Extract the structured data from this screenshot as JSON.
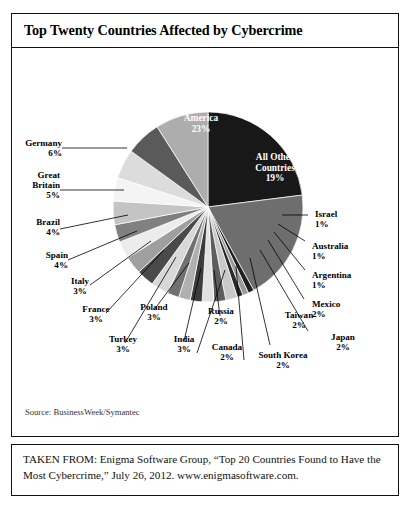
{
  "chart_box": {
    "title": "Top Twenty Countries Affected by Cybercrime",
    "source_note": "Source: BusinessWeek/Symantec"
  },
  "attribution": {
    "text": "TAKEN FROM: Enigma Software Group, “Top 20 Countries Found to Have the Most Cybercrime,” July 26, 2012. www.enigmasoftware.com."
  },
  "chart_data": {
    "type": "pie",
    "title": "Top Twenty Countries Affected by Cybercrime",
    "xlabel": "",
    "ylabel": "",
    "legend": "none",
    "grid": false,
    "units": "percent",
    "start_angle_deg": 0,
    "direction": "clockwise",
    "categories": [
      "United States of America",
      "All Other Countries",
      "Israel",
      "Australia",
      "Argentina",
      "Mexico",
      "Japan",
      "South Korea",
      "Taiwan",
      "Canada",
      "Russia",
      "India",
      "Poland",
      "Turkey",
      "France",
      "Italy",
      "Spain",
      "Brazil",
      "Great Britain",
      "Germany",
      "China"
    ],
    "values": [
      23,
      19,
      1,
      1,
      1,
      2,
      2,
      2,
      2,
      2,
      2,
      3,
      3,
      3,
      3,
      3,
      4,
      4,
      5,
      6,
      9
    ],
    "slices": [
      {
        "name": "United States of America",
        "label": "United States of America",
        "value": 23,
        "pct_text": "23%",
        "color": "#181818",
        "text_color": "#ffffff",
        "placement": "inside"
      },
      {
        "name": "All Other Countries",
        "label": "All Other Countries",
        "value": 19,
        "pct_text": "19%",
        "color": "#6e6e6e",
        "text_color": "#ffffff",
        "placement": "inside"
      },
      {
        "name": "Israel",
        "label": "Israel",
        "value": 1,
        "pct_text": "1%",
        "color": "#1f1f1f",
        "text_color": "#000000",
        "placement": "outside"
      },
      {
        "name": "Australia",
        "label": "Australia",
        "value": 1,
        "pct_text": "1%",
        "color": "#9a9a9a",
        "text_color": "#000000",
        "placement": "outside"
      },
      {
        "name": "Argentina",
        "label": "Argentina",
        "value": 1,
        "pct_text": "1%",
        "color": "#2a2a2a",
        "text_color": "#000000",
        "placement": "outside"
      },
      {
        "name": "Mexico",
        "label": "Mexico",
        "value": 2,
        "pct_text": "2%",
        "color": "#c9c9c9",
        "text_color": "#000000",
        "placement": "outside"
      },
      {
        "name": "Japan",
        "label": "Japan",
        "value": 2,
        "pct_text": "2%",
        "color": "#5d5d5d",
        "text_color": "#000000",
        "placement": "outside"
      },
      {
        "name": "South Korea",
        "label": "South Korea",
        "value": 2,
        "pct_text": "2%",
        "color": "#e2e2e2",
        "text_color": "#000000",
        "placement": "outside"
      },
      {
        "name": "Taiwan",
        "label": "Taiwan",
        "value": 2,
        "pct_text": "2%",
        "color": "#3c3c3c",
        "text_color": "#000000",
        "placement": "outside"
      },
      {
        "name": "Canada",
        "label": "Canada",
        "value": 2,
        "pct_text": "2%",
        "color": "#b0b0b0",
        "text_color": "#000000",
        "placement": "outside"
      },
      {
        "name": "Russia",
        "label": "Russia",
        "value": 2,
        "pct_text": "2%",
        "color": "#717171",
        "text_color": "#000000",
        "placement": "outside"
      },
      {
        "name": "India",
        "label": "India",
        "value": 3,
        "pct_text": "3%",
        "color": "#d8d8d8",
        "text_color": "#000000",
        "placement": "outside"
      },
      {
        "name": "Poland",
        "label": "Poland",
        "value": 3,
        "pct_text": "3%",
        "color": "#4a4a4a",
        "text_color": "#000000",
        "placement": "outside"
      },
      {
        "name": "Turkey",
        "label": "Turkey",
        "value": 3,
        "pct_text": "3%",
        "color": "#9f9f9f",
        "text_color": "#000000",
        "placement": "outside"
      },
      {
        "name": "France",
        "label": "France",
        "value": 3,
        "pct_text": "3%",
        "color": "#ececec",
        "text_color": "#000000",
        "placement": "outside"
      },
      {
        "name": "Italy",
        "label": "Italy",
        "value": 3,
        "pct_text": "3%",
        "color": "#808080",
        "text_color": "#000000",
        "placement": "outside"
      },
      {
        "name": "Spain",
        "label": "Spain",
        "value": 4,
        "pct_text": "4%",
        "color": "#c4c4c4",
        "text_color": "#000000",
        "placement": "outside"
      },
      {
        "name": "Brazil",
        "label": "Brazil",
        "value": 4,
        "pct_text": "4%",
        "color": "#f4f4f4",
        "text_color": "#000000",
        "placement": "outside"
      },
      {
        "name": "Great Britain",
        "label": "Great Britain",
        "value": 5,
        "pct_text": "5%",
        "color": "#dcdcdc",
        "text_color": "#000000",
        "placement": "outside"
      },
      {
        "name": "Germany",
        "label": "Germany",
        "value": 6,
        "pct_text": "6%",
        "color": "#5a5a5a",
        "text_color": "#000000",
        "placement": "outside"
      },
      {
        "name": "China",
        "label": "China",
        "value": 9,
        "pct_text": "9%",
        "color": "#adadad",
        "text_color": "#ffffff",
        "placement": "inside"
      }
    ]
  },
  "labels": {
    "us": {
      "l1": "United",
      "l2": "States of",
      "l3": "America",
      "pct": "23%"
    },
    "other": {
      "l1": "All Other",
      "l2": "Countries",
      "pct": "19%"
    },
    "china": {
      "l1": "China",
      "pct": "9%"
    },
    "germany": {
      "l1": "Germany",
      "pct": "6%"
    },
    "great_britain": {
      "l1": "Great",
      "l2": "Britain",
      "pct": "5%"
    },
    "brazil": {
      "l1": "Brazil",
      "pct": "4%"
    },
    "spain": {
      "l1": "Spain",
      "pct": "4%"
    },
    "italy": {
      "l1": "Italy",
      "pct": "3%"
    },
    "france": {
      "l1": "France",
      "pct": "3%"
    },
    "turkey": {
      "l1": "Turkey",
      "pct": "3%"
    },
    "poland": {
      "l1": "Poland",
      "pct": "3%"
    },
    "india": {
      "l1": "India",
      "pct": "3%"
    },
    "russia": {
      "l1": "Russia",
      "pct": "2%"
    },
    "canada": {
      "l1": "Canada",
      "pct": "2%"
    },
    "south_korea": {
      "l1": "South Korea",
      "pct": "2%"
    },
    "taiwan": {
      "l1": "Taiwan",
      "pct": "2%"
    },
    "japan": {
      "l1": "Japan",
      "pct": "2%"
    },
    "mexico": {
      "l1": "Mexico",
      "pct": "2%"
    },
    "argentina": {
      "l1": "Argentina",
      "pct": "1%"
    },
    "australia": {
      "l1": "Australia",
      "pct": "1%"
    },
    "israel": {
      "l1": "Israel",
      "pct": "1%"
    }
  }
}
